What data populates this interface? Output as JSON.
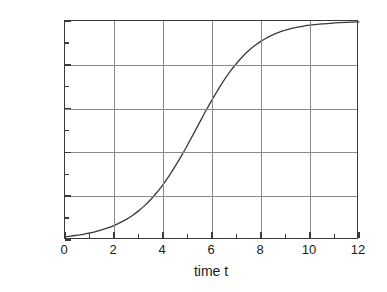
{
  "chart_data": {
    "type": "line",
    "title": "",
    "xlabel": "time t",
    "ylabel": "share x(a,t)",
    "xlim": [
      0,
      12
    ],
    "ylim": [
      0.0,
      1.0
    ],
    "grid": true,
    "legend_position": "none",
    "x_ticks_major": [
      0,
      2,
      4,
      6,
      8,
      10,
      12
    ],
    "x_tick_labels": [
      "0",
      "2",
      "4",
      "6",
      "8",
      "10",
      "12"
    ],
    "x_ticks_minor": [
      1,
      3,
      5,
      7,
      9,
      11
    ],
    "y_ticks_major": [
      0.0,
      0.2,
      0.4,
      0.6,
      0.8,
      1.0
    ],
    "y_tick_labels": [
      "0,0",
      "0,2",
      "0,4",
      "0,6",
      "0,8",
      "1,0"
    ],
    "y_ticks_minor": [
      0.1,
      0.3,
      0.5,
      0.7,
      0.9
    ],
    "series": [
      {
        "name": "share x(a,t)",
        "color": "#3a3a3a",
        "x": [
          0,
          0.25,
          0.5,
          0.75,
          1,
          1.25,
          1.5,
          1.75,
          2,
          2.25,
          2.5,
          2.75,
          3,
          3.25,
          3.5,
          3.75,
          4,
          4.25,
          4.5,
          4.75,
          5,
          5.25,
          5.5,
          5.75,
          6,
          6.25,
          6.5,
          6.75,
          7,
          7.25,
          7.5,
          7.75,
          8,
          8.25,
          8.5,
          8.75,
          9,
          9.25,
          9.5,
          9.75,
          10,
          10.5,
          11,
          11.5,
          12
        ],
        "y": [
          0.015,
          0.018,
          0.022,
          0.026,
          0.032,
          0.038,
          0.046,
          0.055,
          0.066,
          0.079,
          0.094,
          0.112,
          0.133,
          0.157,
          0.185,
          0.217,
          0.253,
          0.293,
          0.337,
          0.384,
          0.434,
          0.486,
          0.538,
          0.59,
          0.64,
          0.687,
          0.731,
          0.771,
          0.806,
          0.838,
          0.865,
          0.888,
          0.908,
          0.924,
          0.938,
          0.949,
          0.958,
          0.966,
          0.972,
          0.977,
          0.981,
          0.987,
          0.991,
          0.994,
          0.996
        ]
      }
    ],
    "annotations": []
  },
  "axes": {
    "y_title": "share x(a,t)",
    "x_title": "time t"
  },
  "colors": {
    "frame": "#3a3a3a",
    "gridline": "#8a8a8a",
    "curve": "#3a3a3a",
    "background": "#ffffff"
  }
}
